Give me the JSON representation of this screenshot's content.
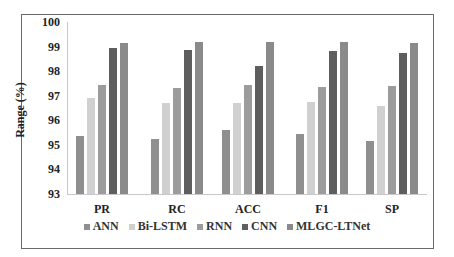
{
  "chart_data": {
    "type": "bar",
    "title": "",
    "xlabel": "",
    "ylabel": "Range (%)",
    "ylim": [
      93,
      100
    ],
    "yticks": [
      93,
      94,
      95,
      96,
      97,
      98,
      99,
      100
    ],
    "categories": [
      "PR",
      "RC",
      "ACC",
      "F1",
      "SP"
    ],
    "series": [
      {
        "name": "ANN",
        "color": "#8f8f8f",
        "values": [
          95.35,
          95.25,
          95.6,
          95.45,
          95.15
        ]
      },
      {
        "name": "Bi-LSTM",
        "color": "#d0d0d0",
        "values": [
          96.9,
          96.7,
          96.7,
          96.75,
          96.6
        ]
      },
      {
        "name": "RNN",
        "color": "#9c9c9c",
        "values": [
          97.45,
          97.3,
          97.45,
          97.35,
          97.4
        ]
      },
      {
        "name": "CNN",
        "color": "#5e5e5e",
        "values": [
          98.95,
          98.85,
          98.2,
          98.8,
          98.75
        ]
      },
      {
        "name": "MLGC-LTNet",
        "color": "#8a8a8a",
        "values": [
          99.15,
          99.2,
          99.2,
          99.2,
          99.15
        ]
      }
    ],
    "legend_position": "bottom",
    "grid": false
  }
}
